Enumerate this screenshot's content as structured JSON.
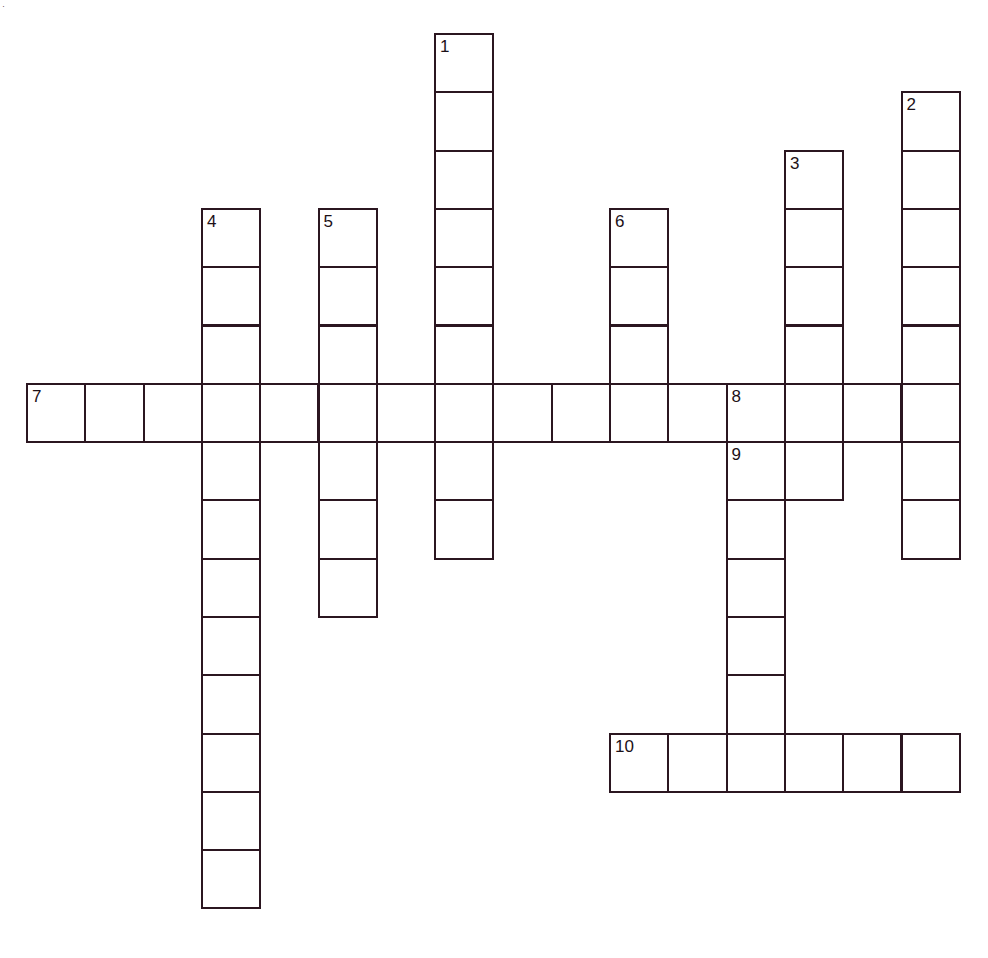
{
  "puzzle": {
    "title": "Crossword Grid",
    "grid": {
      "origin_x": 26,
      "origin_y": 33,
      "cell_size": 58.3,
      "cell_border_color": "#2b1620",
      "cell_fill_color": "#ffffff",
      "background_color": "#ffffff",
      "columns": 17,
      "rows": 16
    },
    "entries": [
      {
        "number": "1",
        "direction": "down",
        "col": 7,
        "row": 0,
        "length": 9
      },
      {
        "number": "2",
        "direction": "down",
        "col": 15,
        "row": 1,
        "length": 8
      },
      {
        "number": "3",
        "direction": "down",
        "col": 13,
        "row": 2,
        "length": 6
      },
      {
        "number": "4",
        "direction": "down",
        "col": 3,
        "row": 3,
        "length": 12
      },
      {
        "number": "5",
        "direction": "down",
        "col": 5,
        "row": 3,
        "length": 7
      },
      {
        "number": "6",
        "direction": "down",
        "col": 10,
        "row": 3,
        "length": 4
      },
      {
        "number": "7",
        "direction": "across",
        "col": 0,
        "row": 6,
        "length": 12
      },
      {
        "number": "8",
        "direction": "across",
        "col": 12,
        "row": 6,
        "length": 4
      },
      {
        "number": "9",
        "direction": "across",
        "col": 12,
        "row": 7,
        "length": 2
      },
      {
        "number": "9",
        "direction": "down",
        "col": 12,
        "row": 7,
        "length": 6
      },
      {
        "number": "10",
        "direction": "across",
        "col": 10,
        "row": 12,
        "length": 6
      }
    ],
    "numbered_cells": [
      {
        "label": "1",
        "col": 7,
        "row": 0
      },
      {
        "label": "2",
        "col": 15,
        "row": 1
      },
      {
        "label": "3",
        "col": 13,
        "row": 2
      },
      {
        "label": "4",
        "col": 3,
        "row": 3
      },
      {
        "label": "5",
        "col": 5,
        "row": 3
      },
      {
        "label": "6",
        "col": 10,
        "row": 3
      },
      {
        "label": "7",
        "col": 0,
        "row": 6
      },
      {
        "label": "8",
        "col": 12,
        "row": 6
      },
      {
        "label": "9",
        "col": 12,
        "row": 7
      },
      {
        "label": "10",
        "col": 10,
        "row": 12
      }
    ],
    "artifacts": [
      {
        "label": "·",
        "x": 2,
        "y": 2
      }
    ]
  }
}
